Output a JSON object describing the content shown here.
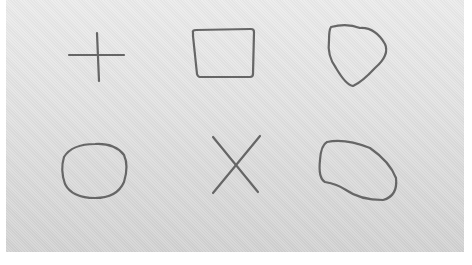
{
  "image": {
    "description": "Six hand-drawn outline shapes on textured gray paper",
    "background_color": "#e0e0e0",
    "stroke_color": "#666666",
    "shapes": [
      {
        "name": "plus",
        "row": 1,
        "col": 1
      },
      {
        "name": "rounded-rectangle",
        "row": 1,
        "col": 2
      },
      {
        "name": "heart-blob",
        "row": 1,
        "col": 3
      },
      {
        "name": "circle",
        "row": 2,
        "col": 1
      },
      {
        "name": "x-cross",
        "row": 2,
        "col": 2
      },
      {
        "name": "irregular-blob",
        "row": 2,
        "col": 3
      }
    ]
  }
}
